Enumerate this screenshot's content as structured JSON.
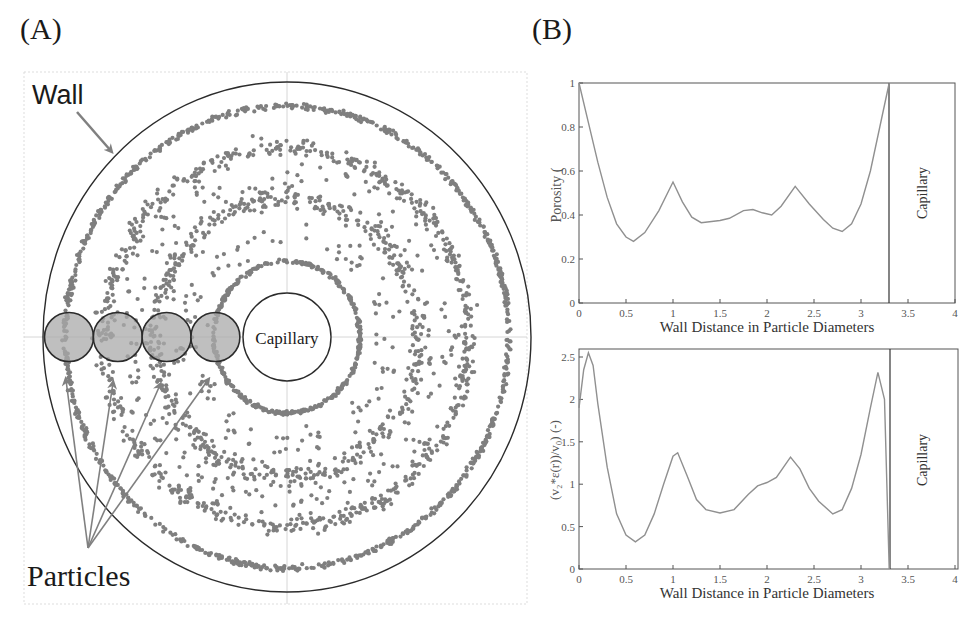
{
  "figure": {
    "panel_a_label": "(A)",
    "panel_b_label": "(B)"
  },
  "panel_a": {
    "wall_label": "Wall",
    "capillary_label": "Capillary",
    "particles_label": "Particles",
    "colors": {
      "dots": "#7f7f7f",
      "particle_fill": "#a9a9a9",
      "outline": "#2b2b2b",
      "arrow": "#808080",
      "grid": "#c8c8c8"
    },
    "particle_circles_count": 4
  },
  "chart_data": [
    {
      "type": "line",
      "title": "",
      "xlabel": "Wall Distance in Particle Diameters",
      "ylabel": "Porosity (-)",
      "xlim": [
        0,
        4
      ],
      "ylim": [
        0,
        1
      ],
      "xticks": [
        "0",
        "0.5",
        "1",
        "1.5",
        "2",
        "2.5",
        "3",
        "3.5",
        "4"
      ],
      "yticks": [
        "0",
        "0.2",
        "0.4",
        "0.6",
        "0.8",
        "1"
      ],
      "annotation": "Capillary",
      "capillary_x": 3.3,
      "grid": false,
      "series": [
        {
          "name": "Porosity",
          "x": [
            0,
            0.1,
            0.2,
            0.3,
            0.4,
            0.5,
            0.58,
            0.7,
            0.85,
            1.0,
            1.1,
            1.2,
            1.3,
            1.5,
            1.6,
            1.75,
            1.85,
            1.95,
            2.05,
            2.15,
            2.3,
            2.45,
            2.6,
            2.7,
            2.8,
            2.9,
            3.0,
            3.1,
            3.2,
            3.3
          ],
          "values": [
            1.0,
            0.82,
            0.64,
            0.48,
            0.36,
            0.3,
            0.28,
            0.32,
            0.42,
            0.55,
            0.46,
            0.39,
            0.365,
            0.375,
            0.385,
            0.42,
            0.425,
            0.41,
            0.4,
            0.44,
            0.53,
            0.45,
            0.38,
            0.34,
            0.325,
            0.36,
            0.45,
            0.6,
            0.8,
            1.0
          ]
        }
      ]
    },
    {
      "type": "line",
      "title": "",
      "xlabel": "Wall Distance in Particle Diameters",
      "ylabel": "(v_z*ε(r))/v_0 (-)",
      "xlim": [
        0,
        4
      ],
      "ylim": [
        0,
        2.6
      ],
      "xticks": [
        "0",
        "0.5",
        "1",
        "1.5",
        "2",
        "2.5",
        "3",
        "3.5",
        "4"
      ],
      "yticks": [
        "0",
        "0.5",
        "1",
        "1.5",
        "2",
        "2.5"
      ],
      "annotation": "Capillary",
      "capillary_x": 3.3,
      "grid": false,
      "series": [
        {
          "name": "Normalized axial velocity",
          "x": [
            0,
            0.05,
            0.1,
            0.15,
            0.2,
            0.3,
            0.4,
            0.5,
            0.6,
            0.7,
            0.8,
            0.9,
            1.0,
            1.05,
            1.15,
            1.25,
            1.35,
            1.5,
            1.65,
            1.8,
            1.9,
            2.0,
            2.1,
            2.25,
            2.35,
            2.45,
            2.55,
            2.7,
            2.8,
            2.9,
            3.0,
            3.1,
            3.18,
            3.25,
            3.3
          ],
          "values": [
            1.9,
            2.35,
            2.55,
            2.4,
            1.95,
            1.2,
            0.65,
            0.4,
            0.32,
            0.4,
            0.65,
            1.0,
            1.33,
            1.37,
            1.1,
            0.82,
            0.7,
            0.66,
            0.7,
            0.88,
            0.98,
            1.02,
            1.08,
            1.32,
            1.18,
            0.95,
            0.8,
            0.65,
            0.7,
            0.95,
            1.35,
            1.9,
            2.32,
            2.0,
            0.0
          ]
        }
      ]
    }
  ],
  "plots": {
    "porosity": {
      "ylabel": "Porosity (",
      "xlabel": "Wall Distance in Particle Diameters",
      "capillary": "Capillary"
    },
    "velocity": {
      "ylabel": "(v₂*ε(r))/v₀) (-)",
      "xlabel": "Wall Distance in Particle Diameters",
      "capillary": "Capillary"
    }
  }
}
